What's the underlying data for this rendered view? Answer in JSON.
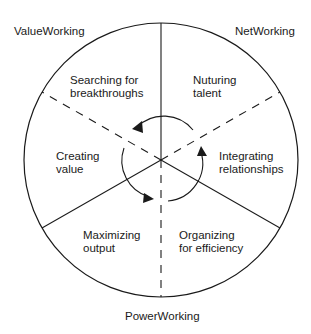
{
  "diagram": {
    "type": "circular-segmented",
    "outer_labels": {
      "top_left": "ValueWorking",
      "top_right": "NetWorking",
      "bottom": "PowerWorking"
    },
    "segments": [
      {
        "line1": "Searching for",
        "line2": "breakthroughs"
      },
      {
        "line1": "Nuturing",
        "line2": "talent"
      },
      {
        "line1": "Integrating",
        "line2": "relationships"
      },
      {
        "line1": "Organizing",
        "line2": "for efficiency"
      },
      {
        "line1": "Maximizing",
        "line2": "output"
      },
      {
        "line1": "Creating",
        "line2": "value"
      }
    ],
    "center_arrows": "counter-clockwise cycle",
    "line_color": "#1a1a1a",
    "background": "#ffffff"
  }
}
